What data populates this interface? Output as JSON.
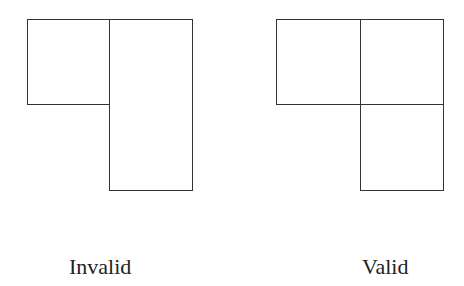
{
  "figures": [
    {
      "label": "Invalid",
      "rects": [
        {
          "x": 27,
          "y": 19,
          "w": 83,
          "h": 86
        },
        {
          "x": 109,
          "y": 19,
          "w": 84,
          "h": 172
        }
      ]
    },
    {
      "label": "Valid",
      "rects": [
        {
          "x": 276,
          "y": 19,
          "w": 85,
          "h": 86
        },
        {
          "x": 360,
          "y": 19,
          "w": 84,
          "h": 86
        },
        {
          "x": 360,
          "y": 104,
          "w": 84,
          "h": 87
        }
      ]
    }
  ],
  "colors": {
    "stroke": "#333333",
    "background": "#ffffff"
  }
}
